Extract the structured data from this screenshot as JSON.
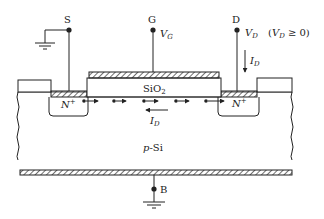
{
  "diagram": {
    "terminals": {
      "source": {
        "label": "S"
      },
      "gate": {
        "label": "G",
        "voltage_main": "V",
        "voltage_sub": "G"
      },
      "drain": {
        "label": "D",
        "voltage_main": "V",
        "voltage_sub": "D",
        "condition_open": "(",
        "condition_main": "V",
        "condition_sub": "D",
        "condition_rest": " ≥ 0)"
      },
      "body": {
        "label": "B"
      }
    },
    "regions": {
      "oxide": {
        "main": "SiO",
        "sub": "2"
      },
      "source_well": {
        "main": "N",
        "sup": "+"
      },
      "drain_well": {
        "main": "N",
        "sup": "+"
      },
      "substrate": {
        "prefix": "p",
        "rest": "-Si"
      }
    },
    "currents": {
      "drain_current": {
        "main": "I",
        "sub": "D"
      },
      "channel_current": {
        "main": "I",
        "sub": "D"
      }
    },
    "colors": {
      "line": "#222222",
      "background": "#ffffff"
    }
  }
}
